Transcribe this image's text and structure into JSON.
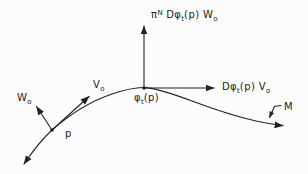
{
  "colors": {
    "background": "#fcfcfc",
    "ink": "#232323"
  },
  "labels": {
    "normal_pushforward": {
      "pi": "π",
      "exp": "N",
      "body": " Dφ",
      "flow_sub": "t",
      "rest": "(p) W",
      "vec_sub": "o"
    },
    "tangent_pushforward": {
      "body": "Dφ",
      "flow_sub": "t",
      "rest": "(p) V",
      "vec_sub": "o"
    },
    "flow_point": {
      "body": "φ",
      "flow_sub": "t",
      "rest": "(p)"
    },
    "w_vector": {
      "body": "W",
      "vec_sub": "o"
    },
    "v_vector": {
      "body": "V",
      "vec_sub": "o"
    },
    "point_p": "p",
    "manifold": "M"
  }
}
